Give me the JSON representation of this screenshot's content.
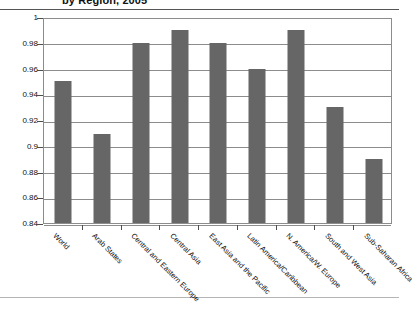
{
  "chart_data": {
    "type": "bar",
    "title": "by Region, 2005",
    "xlabel": "",
    "ylabel": "",
    "ylim": [
      0.84,
      1
    ],
    "ytick_labels": [
      "1",
      "0.98",
      "0.96",
      "0.94",
      "0.92",
      "0.9",
      "0.88",
      "0.86",
      "0.84"
    ],
    "ytick_values": [
      1,
      0.98,
      0.96,
      0.94,
      0.92,
      0.9,
      0.88,
      0.86,
      0.84
    ],
    "grid": true,
    "legend": "none",
    "bar_color": "#666666",
    "categories": [
      "World",
      "Arab States",
      "Central and Eastern Europe",
      "Central Asia",
      "East Asia and the Pacific",
      "Latin America/Caribbean",
      "N. America/W. Europe",
      "South and West Asia",
      "Sub-Saharan Africa"
    ],
    "values": [
      0.95,
      0.909,
      0.98,
      0.99,
      0.98,
      0.96,
      0.99,
      0.93,
      0.89
    ]
  }
}
